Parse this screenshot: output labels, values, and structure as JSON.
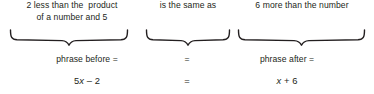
{
  "diagram": {
    "background_color": "#ffffff",
    "text_color": "#231f20",
    "brace_color": "#231f20"
  },
  "phrases": {
    "left": {
      "line1": "2 less than the  product",
      "line2": "of a number and 5"
    },
    "middle": {
      "line1": "is the same as"
    },
    "right": {
      "line1": "6 more than the number"
    }
  },
  "labels": {
    "left": "phrase before =",
    "middle": "=",
    "right": "phrase after ="
  },
  "expressions": {
    "left_coefficient_term": "5",
    "left_variable": "x",
    "left_operator_and_constant": " – 2",
    "middle": "=",
    "right_variable": "x",
    "right_operator_and_constant": " + 6"
  },
  "braces": {
    "left_label": "underbrace-left",
    "middle_label": "underbrace-middle",
    "right_label": "underbrace-right"
  }
}
